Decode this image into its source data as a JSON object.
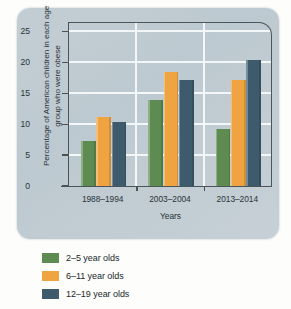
{
  "chart_data": {
    "type": "bar",
    "title": "",
    "xlabel": "Years",
    "ylabel": "Percentage of American children in each age group who were obese",
    "categories": [
      "1988–1994",
      "2003–2004",
      "2013–2014"
    ],
    "series": [
      {
        "name": "2–5 year olds",
        "values": [
          7.2,
          13.9,
          9.2
        ],
        "color": "#5d8b51"
      },
      {
        "name": "6–11 year olds",
        "values": [
          11.2,
          18.4,
          17.1
        ],
        "color": "#f0a341"
      },
      {
        "name": "12–19 year olds",
        "values": [
          10.4,
          17.1,
          20.3
        ],
        "color": "#3d5b6d"
      }
    ],
    "ylim": [
      0,
      26.5
    ],
    "yticks": [
      0,
      5,
      10,
      15,
      20,
      25
    ],
    "ytick_labels": [
      "0",
      "5",
      "10",
      "15",
      "20",
      "25"
    ],
    "grid": "horizontal-and-group-separators",
    "legend_position": "below-outside"
  },
  "legend": {
    "items": [
      {
        "label": "2–5 year olds",
        "color": "#5d8b51"
      },
      {
        "label": "6–11 year olds",
        "color": "#f0a341"
      },
      {
        "label": "12–19 year olds",
        "color": "#3d5b6d"
      }
    ]
  },
  "colors": {
    "card_background": "#c3ced4",
    "plot_background": "#c9d3d8",
    "gridline": "#f4f7f8",
    "axis": "#4a5357",
    "text": "#2a3338",
    "page_background": "#fdfdfb"
  }
}
